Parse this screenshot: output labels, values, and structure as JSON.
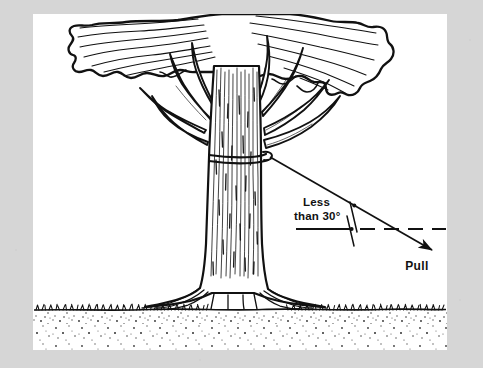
{
  "figure": {
    "name": "tree-pull-angle-diagram",
    "type": "line-art-illustration",
    "background_color": "#d6d6d6",
    "canvas_color": "#ffffff",
    "ink_color": "#111111",
    "canvas": {
      "x": 33,
      "y": 14,
      "width": 414,
      "height": 336
    }
  },
  "labels": {
    "angle_line1": "Less",
    "angle_line2": "than 30°",
    "pull": "Pull"
  },
  "annotations": {
    "angle_value": "30°",
    "angle_qualifier": "Less than",
    "force_direction": "Pull"
  },
  "elements": {
    "tree": "broadleaf-tree",
    "rope": "rope-tie-around-trunk",
    "pull_line": "angled-solid-line-with-arrowhead",
    "reference_line": "dashed-horizontal-line",
    "angle_ticks": "two-tick-marks",
    "ground": "grass-and-soil-band"
  }
}
